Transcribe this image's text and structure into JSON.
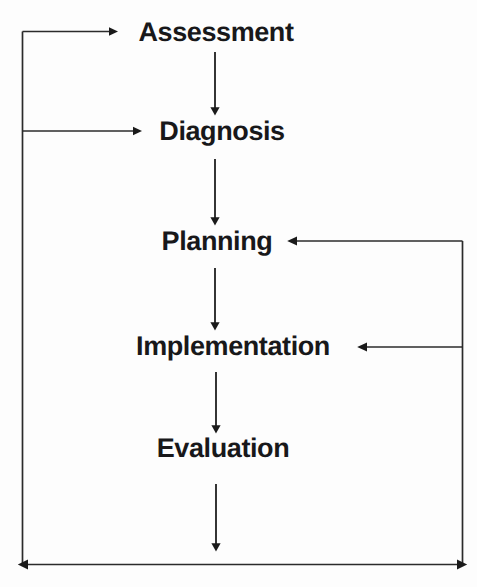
{
  "diagram": {
    "type": "flowchart",
    "background_color": "#fdfdfd",
    "line_color": "#1a1a1a",
    "text_color": "#18181a",
    "nodes": [
      {
        "id": "assessment",
        "label": "Assessment",
        "cx": 216,
        "cy": 32
      },
      {
        "id": "diagnosis",
        "label": "Diagnosis",
        "cx": 222,
        "cy": 131
      },
      {
        "id": "planning",
        "label": "Planning",
        "cx": 217,
        "cy": 241
      },
      {
        "id": "implementation",
        "label": "Implementation",
        "cx": 233,
        "cy": 346
      },
      {
        "id": "evaluation",
        "label": "Evaluation",
        "cx": 223,
        "cy": 448
      }
    ],
    "edges": [
      {
        "id": "assessment-to-diagnosis",
        "from": "assessment",
        "to": "diagnosis",
        "direction": "down"
      },
      {
        "id": "diagnosis-to-planning",
        "from": "diagnosis",
        "to": "planning",
        "direction": "down"
      },
      {
        "id": "planning-to-implementation",
        "from": "planning",
        "to": "implementation",
        "direction": "down"
      },
      {
        "id": "implementation-to-evaluation",
        "from": "implementation",
        "to": "evaluation",
        "direction": "down"
      },
      {
        "id": "evaluation-to-feedback-bus",
        "from": "evaluation",
        "to": "feedback-bus",
        "direction": "down"
      },
      {
        "id": "feedback-to-assessment",
        "from": "feedback-bus",
        "to": "assessment",
        "direction": "right"
      },
      {
        "id": "feedback-to-diagnosis",
        "from": "feedback-bus",
        "to": "diagnosis",
        "direction": "right"
      },
      {
        "id": "feedback-to-planning",
        "from": "feedback-bus",
        "to": "planning",
        "direction": "left"
      },
      {
        "id": "feedback-to-implementation",
        "from": "feedback-bus",
        "to": "implementation",
        "direction": "left"
      }
    ]
  }
}
